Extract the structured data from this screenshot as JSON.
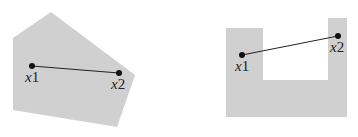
{
  "figure": {
    "fill_color": "#d0d0d0",
    "line_color": "#222222",
    "convex_set": {
      "polygon": "51,12 135,75 117,127 13,110 13,38",
      "x1": {
        "x": 32,
        "y": 66,
        "label_var": "x",
        "label_sub": "1"
      },
      "x2": {
        "x": 119,
        "y": 73,
        "label_var": "x",
        "label_sub": "2"
      }
    },
    "nonconvex_set": {
      "polygon": "226,28 263,28 263,80 328,80 328,18 347,18 347,117 226,117",
      "x1": {
        "x": 242,
        "y": 55,
        "label_var": "x",
        "label_sub": "1"
      },
      "x2": {
        "x": 338,
        "y": 36,
        "label_var": "x",
        "label_sub": "2"
      }
    }
  }
}
